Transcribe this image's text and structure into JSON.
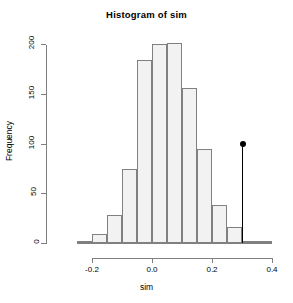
{
  "chart_data": {
    "type": "bar",
    "title": "Histogram of sim",
    "xlabel": "sim",
    "ylabel": "Frequency",
    "xlim": [
      -0.27,
      0.42
    ],
    "ylim": [
      0,
      205
    ],
    "grid": false,
    "legend": null,
    "x_ticks": [
      -0.2,
      0.0,
      0.2,
      0.4
    ],
    "x_tick_labels": [
      "-0.2",
      "0.0",
      "0.2",
      "0.4"
    ],
    "y_ticks": [
      0,
      50,
      100,
      150,
      200
    ],
    "y_tick_labels": [
      "0",
      "50",
      "100",
      "150",
      "200"
    ],
    "bin_width": 0.05,
    "bin_edges": [
      -0.25,
      -0.2,
      -0.15,
      -0.1,
      -0.05,
      0.0,
      0.05,
      0.1,
      0.15,
      0.2,
      0.25,
      0.3,
      0.35,
      0.4
    ],
    "categories": [
      "-0.25",
      "-0.20",
      "-0.15",
      "-0.10",
      "-0.05",
      "0.00",
      "0.05",
      "0.10",
      "0.15",
      "0.20",
      "0.25",
      "0.30",
      "0.35"
    ],
    "values": [
      2,
      9,
      28,
      75,
      184,
      200,
      201,
      156,
      95,
      38,
      16,
      2,
      2
    ],
    "bar_fill_color": "#f2f2f2",
    "bar_edge_color": "#808080",
    "annotation": {
      "label": "observed-statistic-marker",
      "x": 0.3,
      "y": 100,
      "color": "#000000",
      "marker": "filled-circle"
    }
  }
}
